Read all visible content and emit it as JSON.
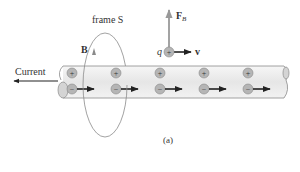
{
  "diagram": {
    "frame_label": "frame S",
    "field_label": "B",
    "force_label": "F",
    "force_subscript": "B",
    "charge_label": "q",
    "velocity_label": "v",
    "current_label": "Current",
    "caption": "(a)",
    "positive_symbol": "+",
    "negative_symbol": "−",
    "colors": {
      "wire_fill": "#ececec",
      "wire_stroke": "#8a8a8a",
      "charge_fill": "#b5b5b5",
      "arrow": "#222222",
      "force_arrow": "#999999",
      "loop": "#8a8a8a",
      "text": "#333333"
    },
    "positive_charges_x": [
      72,
      116,
      160,
      204,
      248
    ],
    "negative_charges_x": [
      72,
      116,
      160,
      204,
      248
    ]
  }
}
